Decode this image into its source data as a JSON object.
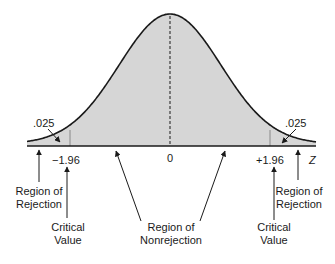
{
  "diagram": {
    "type": "two-tailed normal distribution with rejection regions",
    "colors": {
      "curve": "#1a1a1a",
      "fill": "#d6d6d6",
      "axis": "#1a1a1a",
      "background": "#ffffff"
    },
    "tail_area_left": ".025",
    "tail_area_right": ".025",
    "axis_labels": {
      "left_critical": "−1.96",
      "center": "0",
      "right_critical": "+1.96",
      "axis_variable": "Z"
    },
    "annotations": {
      "left_rejection": [
        "Region of",
        "Rejection"
      ],
      "left_critical_value": [
        "Critical",
        "Value"
      ],
      "nonrejection": [
        "Region of",
        "Nonrejection"
      ],
      "right_critical_value": [
        "Critical",
        "Value"
      ],
      "right_rejection": [
        "Region of",
        "Rejection"
      ]
    }
  }
}
